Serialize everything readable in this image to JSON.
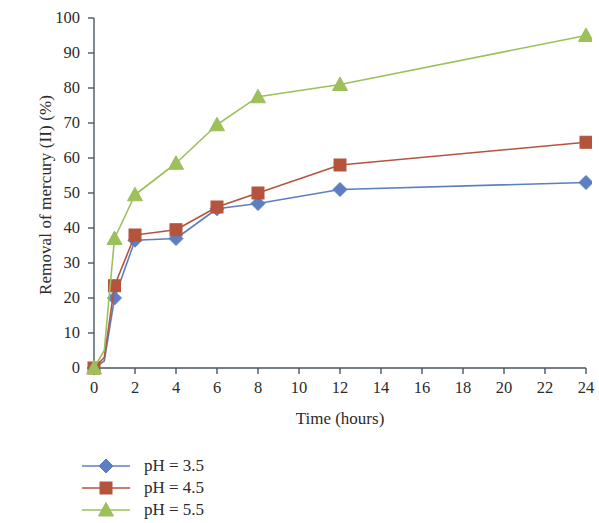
{
  "chart_data": {
    "type": "line",
    "title": "",
    "xlabel": "Time (hours)",
    "ylabel": "Removal of mercury (II) (%)",
    "xlim": [
      0,
      24
    ],
    "ylim": [
      0,
      100
    ],
    "x_ticks": [
      0,
      2,
      4,
      6,
      8,
      10,
      12,
      14,
      16,
      18,
      20,
      22,
      24
    ],
    "y_ticks": [
      0,
      10,
      20,
      30,
      40,
      50,
      60,
      70,
      80,
      90,
      100
    ],
    "grid": false,
    "legend_position": "bottom-left",
    "x": [
      0,
      0.5,
      1,
      2,
      4,
      6,
      8,
      12,
      24
    ],
    "series": [
      {
        "name": "pH = 3.5",
        "color": "#5b7fc0",
        "marker": "diamond",
        "values": [
          0,
          2,
          20,
          36.5,
          37,
          45.5,
          47,
          51,
          53
        ]
      },
      {
        "name": "pH = 4.5",
        "color": "#b4543d",
        "marker": "square",
        "values": [
          0,
          3,
          23.5,
          38,
          39.5,
          46,
          50,
          58,
          64.5
        ]
      },
      {
        "name": "pH = 5.5",
        "color": "#9cc05a",
        "marker": "triangle",
        "values": [
          0,
          5,
          37,
          49.5,
          58.5,
          69.5,
          77.5,
          81,
          95
        ]
      }
    ]
  },
  "axis": {
    "y_tick_labels": [
      "0",
      "10",
      "20",
      "30",
      "40",
      "50",
      "60",
      "70",
      "80",
      "90",
      "100"
    ],
    "x_tick_labels": [
      "0",
      "2",
      "4",
      "6",
      "8",
      "10",
      "12",
      "14",
      "16",
      "18",
      "20",
      "22",
      "24"
    ]
  },
  "legend": {
    "items": [
      {
        "label": "pH = 3.5"
      },
      {
        "label": "pH = 4.5"
      },
      {
        "label": "pH = 5.5"
      }
    ]
  }
}
